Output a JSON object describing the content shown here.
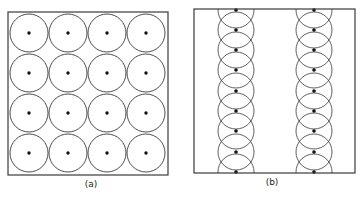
{
  "colors": {
    "stroke": "#3a3a3a",
    "dot": "#111111",
    "background": "#ffffff"
  },
  "panels": [
    {
      "id": "a",
      "label": "(a)",
      "label_pos": {
        "x": 91,
        "y": 179
      },
      "box": {
        "x": 8,
        "y": 12,
        "w": 160,
        "h": 163
      },
      "layout": "square-grid",
      "rows": 4,
      "cols": 4,
      "circle_radius": 19,
      "centers_x": [
        29,
        68,
        107,
        146
      ],
      "centers_y": [
        33,
        73,
        113,
        153
      ]
    },
    {
      "id": "b",
      "label": "(b)",
      "label_pos": {
        "x": 272,
        "y": 177
      },
      "box": {
        "x": 194,
        "y": 9,
        "w": 161,
        "h": 164
      },
      "layout": "overlapping-chains",
      "circle_radius": 18,
      "chains_x": [
        236,
        314
      ],
      "centers_y": [
        10,
        30,
        50,
        70,
        91,
        111,
        131,
        152,
        172
      ]
    }
  ]
}
